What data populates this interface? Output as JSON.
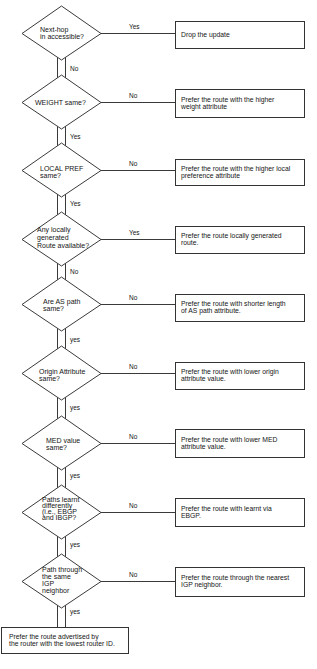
{
  "flowchart": {
    "decisions": [
      {
        "question": [
          "Next-hop",
          "in accessible?"
        ],
        "side_label": "Yes",
        "action": [
          "Drop the update"
        ],
        "down_label": "No"
      },
      {
        "question": [
          "WEIGHT same?"
        ],
        "side_label": "No",
        "action": [
          "Prefer the route with the higher",
          "weight attribute"
        ],
        "down_label": "Yes"
      },
      {
        "question": [
          "LOCAL PREF",
          "same?"
        ],
        "side_label": "No",
        "action": [
          "Prefer the route with the higher local",
          "preference attribute"
        ],
        "down_label": "Yes"
      },
      {
        "question": [
          "Any locally",
          "generated",
          "Route available?"
        ],
        "side_label": "Yes",
        "action": [
          "Prefer the route locally generated",
          "route."
        ],
        "down_label": "No"
      },
      {
        "question": [
          "Are AS path",
          "same?"
        ],
        "side_label": "No",
        "action": [
          "Prefer the route with shorter length",
          "of AS path attribute."
        ],
        "down_label": "yes"
      },
      {
        "question": [
          "Origin Attribute",
          "same?"
        ],
        "side_label": "No",
        "action": [
          "Prefer the route with lower origin",
          "attribute value."
        ],
        "down_label": "yes"
      },
      {
        "question": [
          "MED value",
          "same?"
        ],
        "side_label": "No",
        "action": [
          "Prefer the route with lower MED",
          "attribute value."
        ],
        "down_label": "yes"
      },
      {
        "question": [
          "Paths learnt",
          "differently",
          "(i.e., EBGP",
          "and IBGP?"
        ],
        "side_label": "No",
        "action": [
          "Prefer the route with learnt via",
          "EBGP."
        ],
        "down_label": "yes"
      },
      {
        "question": [
          "Path through",
          "the same",
          "IGP",
          "neighbor"
        ],
        "side_label": "No",
        "action": [
          "Prefer the route through the nearest",
          "IGP neighbor."
        ],
        "down_label": "yes"
      }
    ],
    "final_action": [
      "Prefer the route advertised by",
      "the router with the lowest router ID."
    ],
    "colors": {
      "line": "#3a3a3a",
      "text": "#151515",
      "background": "#ffffff"
    }
  }
}
